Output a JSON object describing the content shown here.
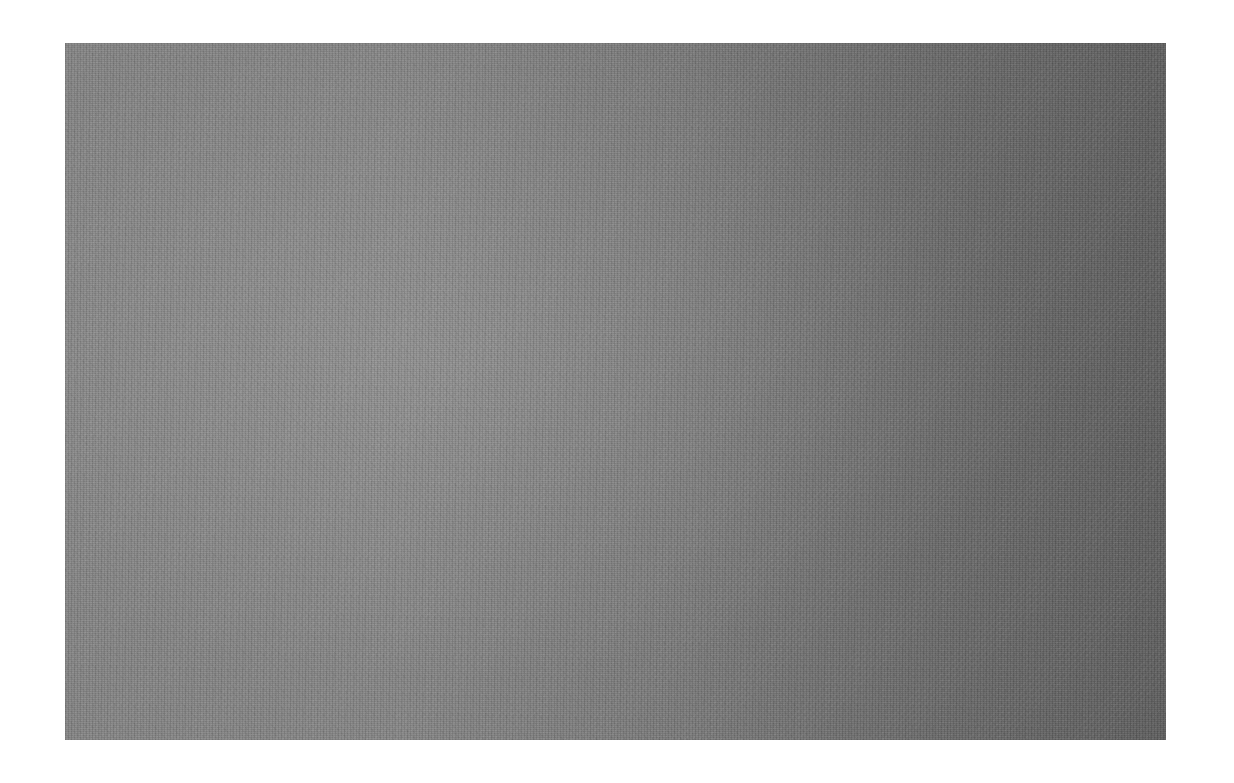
{
  "image": {
    "description": "Gray textured surface (felt or paper) on a white background",
    "colors": {
      "background": "#ffffff",
      "texture_light": "#868686",
      "texture_dark": "#5f5f5f"
    }
  }
}
